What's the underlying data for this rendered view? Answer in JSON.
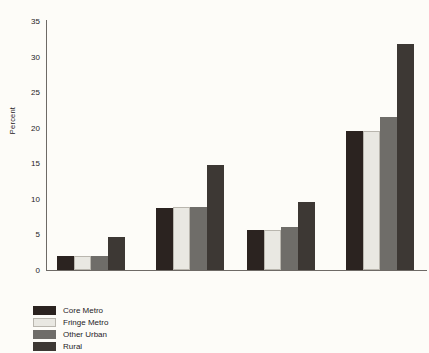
{
  "chart_data": {
    "type": "bar",
    "title": "",
    "xlabel": "",
    "ylabel": "Percent",
    "ylim": [
      0,
      35
    ],
    "yticks": [
      0,
      5,
      10,
      15,
      20,
      25,
      30,
      35
    ],
    "grid": false,
    "legend_position": "bottom-left",
    "group_labels": [
      "Married",
      "Single Parent"
    ],
    "categories": [
      "Nonhispanic White",
      "Minority",
      "Nonhispanic White",
      "Minority"
    ],
    "series": [
      {
        "name": "Core Metro",
        "color": "#2b2320",
        "values": [
          1.9,
          8.7,
          5.6,
          19.6
        ]
      },
      {
        "name": "Fringe Metro",
        "color": "#e9e8e2",
        "values": [
          1.9,
          8.8,
          5.6,
          19.6
        ]
      },
      {
        "name": "Other Urban",
        "color": "#6f6d69",
        "values": [
          1.9,
          8.9,
          6.1,
          21.5
        ]
      },
      {
        "name": "Rural",
        "color": "#3d3834",
        "values": [
          4.7,
          14.7,
          9.5,
          31.7
        ]
      }
    ]
  },
  "legend": {
    "items": [
      {
        "label": "Core Metro"
      },
      {
        "label": "Fringe Metro"
      },
      {
        "label": "Other Urban"
      },
      {
        "label": "Rural"
      }
    ]
  }
}
